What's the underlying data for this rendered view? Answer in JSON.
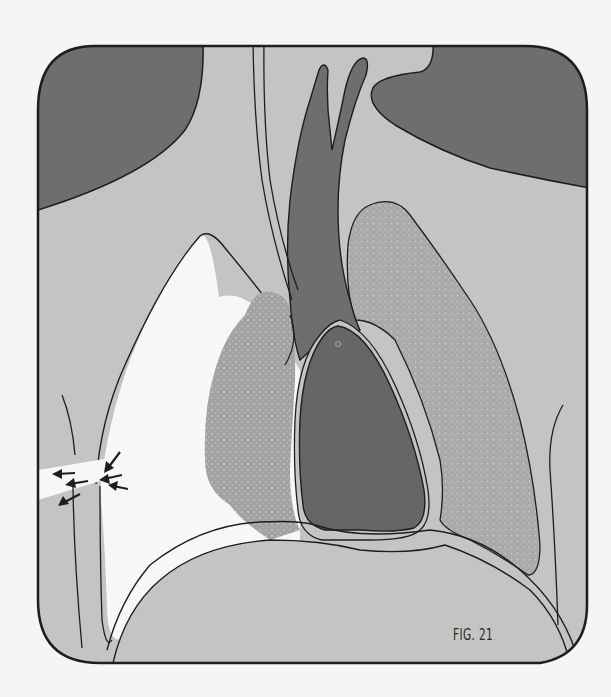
{
  "figure": {
    "label": "FIG. 21",
    "colors": {
      "page_background": "#f5f5f3",
      "frame_stroke": "#1e1e1e",
      "soft_tissue_fill": "#c4c4c2",
      "dark_tissue_fill": "#6e6e6c",
      "heart_fill": "#666664",
      "lung_fill": "#a9a9a7",
      "collapsed_lung_fill": "#a2a2a0",
      "air_space_fill": "#f7f7f5",
      "arrow_color": "#1e1e1e"
    },
    "regions": [
      {
        "name": "left-shoulder-tissue",
        "shade": "dark"
      },
      {
        "name": "right-shoulder-tissue",
        "shade": "dark"
      },
      {
        "name": "trachea-and-bronchi",
        "shade": "dark"
      },
      {
        "name": "heart",
        "shade": "dark"
      },
      {
        "name": "collapsed-lung",
        "shade": "stippled-gray"
      },
      {
        "name": "normal-lung",
        "shade": "stippled-gray"
      },
      {
        "name": "pleural-air-space",
        "shade": "white"
      },
      {
        "name": "diaphragm",
        "shade": "light-gray"
      },
      {
        "name": "chest-wall-wound-arrows",
        "count": 6
      }
    ]
  }
}
